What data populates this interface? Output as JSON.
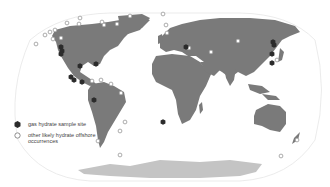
{
  "map": {
    "projection": "Robinson-like world map",
    "colors": {
      "land": "#7a7a7a",
      "antarctica": "#c4c4c4",
      "ocean": "#ffffff",
      "graticule_outline": "#e6e6e6",
      "sample_site": "#2b2b2b",
      "offshore_marker_stroke": "#8a8a8a"
    },
    "sample_sites": [
      [
        61,
        47
      ],
      [
        62,
        51
      ],
      [
        61,
        54
      ],
      [
        80,
        66
      ],
      [
        96,
        64
      ],
      [
        71,
        77
      ],
      [
        74,
        80
      ],
      [
        82,
        82
      ],
      [
        94,
        100
      ],
      [
        186,
        47
      ],
      [
        273,
        42
      ],
      [
        274,
        45
      ],
      [
        272,
        54
      ],
      [
        272,
        63
      ],
      [
        163,
        122
      ]
    ],
    "offshore_occurrences": [
      [
        36,
        44
      ],
      [
        45,
        35
      ],
      [
        50,
        32
      ],
      [
        53,
        39
      ],
      [
        61,
        38
      ],
      [
        67,
        23
      ],
      [
        79,
        24
      ],
      [
        102,
        22
      ],
      [
        104,
        25
      ],
      [
        117,
        24
      ],
      [
        130,
        16
      ],
      [
        163,
        14
      ],
      [
        166,
        25
      ],
      [
        167,
        33
      ],
      [
        189,
        48
      ],
      [
        211,
        52
      ],
      [
        238,
        41
      ],
      [
        277,
        60
      ],
      [
        92,
        81
      ],
      [
        101,
        80
      ],
      [
        111,
        84
      ],
      [
        121,
        93
      ],
      [
        125,
        122
      ],
      [
        120,
        131
      ],
      [
        98,
        141
      ],
      [
        120,
        155
      ],
      [
        297,
        140
      ],
      [
        281,
        156
      ],
      [
        80,
        18
      ],
      [
        55,
        30
      ]
    ]
  },
  "legend": {
    "items": [
      {
        "symbol": "filled-hexagon",
        "label": "gas hydrate sample site"
      },
      {
        "symbol": "open-circle",
        "label": "other likely hydrate offshore occurrences"
      }
    ]
  }
}
